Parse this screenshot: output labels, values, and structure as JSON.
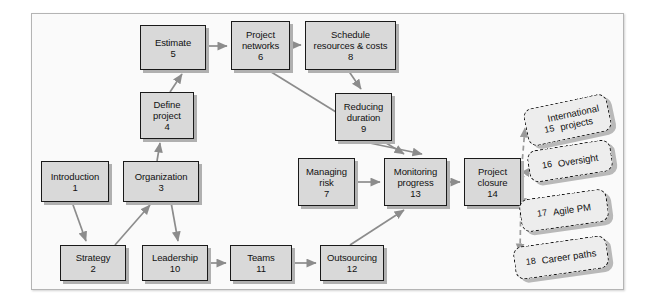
{
  "diagram": {
    "frame": {
      "border_color": "#b4b4b4",
      "background": "#fafafa"
    },
    "style": {
      "node_fill": "#d9d9d9",
      "node_border": "#1a1a1a",
      "node_shadow": "#b0b0b0",
      "dashed_fill": "#ededed",
      "dashed_border": "#111111",
      "connector_color": "#8c8c8c",
      "dashed_connector_color": "#9a9a9a"
    },
    "nodes": [
      {
        "id": "n1",
        "title": "Introduction",
        "number": "1",
        "x": 41,
        "y": 161,
        "w": 68,
        "h": 41
      },
      {
        "id": "n2",
        "title": "Strategy",
        "number": "2",
        "x": 60,
        "y": 245,
        "w": 66,
        "h": 36
      },
      {
        "id": "n3",
        "title": "Organization",
        "number": "3",
        "x": 123,
        "y": 161,
        "w": 76,
        "h": 41
      },
      {
        "id": "n4",
        "title": "Define\nproject",
        "number": "4",
        "x": 140,
        "y": 92,
        "w": 54,
        "h": 47
      },
      {
        "id": "n5",
        "title": "Estimate",
        "number": "5",
        "x": 140,
        "y": 25,
        "w": 66,
        "h": 45
      },
      {
        "id": "n6",
        "title": "Project\nnetworks",
        "number": "6",
        "x": 231,
        "y": 21,
        "w": 59,
        "h": 49
      },
      {
        "id": "n7",
        "title": "Managing\nrisk",
        "number": "7",
        "x": 298,
        "y": 158,
        "w": 57,
        "h": 48
      },
      {
        "id": "n8",
        "title": "Schedule\nresources & costs",
        "number": "8",
        "x": 305,
        "y": 21,
        "w": 91,
        "h": 49
      },
      {
        "id": "n9",
        "title": "Reducing\nduration",
        "number": "9",
        "x": 335,
        "y": 93,
        "w": 57,
        "h": 48
      },
      {
        "id": "n10",
        "title": "Leadership",
        "number": "10",
        "x": 142,
        "y": 245,
        "w": 66,
        "h": 36
      },
      {
        "id": "n11",
        "title": "Teams",
        "number": "11",
        "x": 230,
        "y": 245,
        "w": 62,
        "h": 36
      },
      {
        "id": "n12",
        "title": "Outsourcing",
        "number": "12",
        "x": 320,
        "y": 245,
        "w": 64,
        "h": 36
      },
      {
        "id": "n13",
        "title": "Monitoring\nprogress",
        "number": "13",
        "x": 384,
        "y": 158,
        "w": 63,
        "h": 48
      },
      {
        "id": "n14",
        "title": "Project\nclosure",
        "number": "14",
        "x": 464,
        "y": 158,
        "w": 57,
        "h": 48
      }
    ],
    "dashed_nodes": [
      {
        "id": "d15",
        "title": "International\nprojects",
        "number": "15",
        "x": 525,
        "y": 101,
        "w": 85,
        "h": 38,
        "rotate": -12,
        "wrap": true
      },
      {
        "id": "d16",
        "title": "Oversight",
        "number": "16",
        "x": 528,
        "y": 145,
        "w": 84,
        "h": 32,
        "rotate": -9,
        "wrap": false
      },
      {
        "id": "d17",
        "title": "Agile PM",
        "number": "17",
        "x": 520,
        "y": 194,
        "w": 88,
        "h": 33,
        "rotate": -8,
        "wrap": false
      },
      {
        "id": "d18",
        "title": "Career paths",
        "number": "18",
        "x": 514,
        "y": 241,
        "w": 94,
        "h": 33,
        "rotate": -8,
        "wrap": false
      }
    ],
    "connectors": [
      {
        "from": "n1",
        "to": "n2",
        "type": "solid"
      },
      {
        "from": "n2",
        "to": "n3",
        "type": "solid"
      },
      {
        "from": "n3",
        "to": "n4",
        "type": "solid"
      },
      {
        "from": "n3",
        "to": "n10",
        "type": "solid"
      },
      {
        "from": "n4",
        "to": "n5",
        "type": "solid"
      },
      {
        "from": "n5",
        "to": "n6",
        "type": "solid"
      },
      {
        "from": "n6",
        "to": "n8",
        "type": "solid"
      },
      {
        "from": "n6",
        "to": "n13",
        "type": "solid"
      },
      {
        "from": "n8",
        "to": "n9",
        "type": "solid"
      },
      {
        "from": "n9",
        "to": "n13",
        "type": "solid"
      },
      {
        "from": "n10",
        "to": "n11",
        "type": "solid"
      },
      {
        "from": "n11",
        "to": "n12",
        "type": "solid"
      },
      {
        "from": "n12",
        "to": "n13",
        "type": "solid"
      },
      {
        "from": "n7",
        "to": "n13",
        "type": "solid"
      },
      {
        "from": "n13",
        "to": "n14",
        "type": "solid"
      },
      {
        "from": "n14",
        "to": "d15",
        "type": "dashed"
      },
      {
        "from": "n14",
        "to": "d16",
        "type": "dashed"
      },
      {
        "from": "n14",
        "to": "d17",
        "type": "dashed"
      },
      {
        "from": "n14",
        "to": "d18",
        "type": "dashed"
      }
    ]
  }
}
